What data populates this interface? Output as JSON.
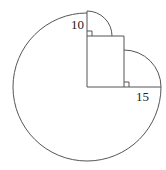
{
  "diagram": {
    "labels": {
      "top_radius": "10",
      "right_radius": "15"
    },
    "colors": {
      "stroke": "#555555",
      "text": "#222222",
      "background": "#ffffff"
    }
  }
}
